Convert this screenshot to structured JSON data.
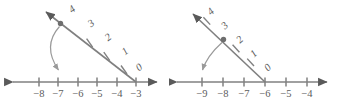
{
  "figure": {
    "type": "number-line-pair"
  },
  "panels": [
    {
      "id": "left",
      "axis": {
        "labels": [
          "−8",
          "−7",
          "−6",
          "−5",
          "−4",
          "−3"
        ],
        "values": [
          -8,
          -7,
          -6,
          -5,
          -4,
          -3
        ],
        "left_arrow": true,
        "right_arrow": true
      },
      "ray": {
        "labels": [
          "0",
          "1",
          "2",
          "3",
          "4"
        ],
        "values": [
          0,
          1,
          2,
          3,
          4
        ],
        "origin_axis_label": "−3",
        "arrow_at_top": true
      },
      "marked_point": {
        "ray_label": "4",
        "ray_value": 4
      },
      "sweep_arrow": {
        "from_ray_label": "4",
        "to_axis_label": "−7",
        "to_axis_value": -7
      }
    },
    {
      "id": "right",
      "axis": {
        "labels": [
          "−9",
          "−8",
          "−7",
          "−6",
          "−5",
          "−4"
        ],
        "values": [
          -9,
          -8,
          -7,
          -6,
          -5,
          -4
        ],
        "left_arrow": true,
        "right_arrow": true
      },
      "ray": {
        "labels": [
          "0",
          "1",
          "2",
          "3",
          "4"
        ],
        "values": [
          0,
          1,
          2,
          3,
          4
        ],
        "origin_axis_label": "−6",
        "arrow_at_top": true
      },
      "marked_point": {
        "ray_label": "3",
        "ray_value": 3
      },
      "sweep_arrow": {
        "from_ray_label": "3",
        "to_axis_label": "−9",
        "to_axis_value": -9
      }
    }
  ],
  "colors": {
    "line": "#808080",
    "label": "#5c5c5c",
    "arc": "#9a9a9a",
    "dot": "#6e6e6e",
    "arrowhead": "#5a5a5a",
    "background": "#ffffff"
  }
}
